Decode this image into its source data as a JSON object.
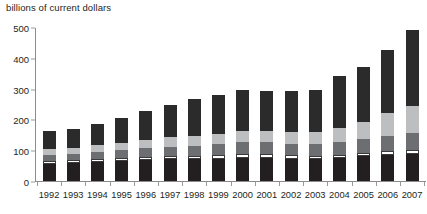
{
  "chart_data": {
    "type": "bar",
    "subtype": "stacked-bar",
    "title": "billions of current dollars",
    "xlabel": "",
    "ylabel": "billions of current dollars",
    "ylim": [
      0,
      500
    ],
    "yticks": [
      0,
      100,
      200,
      300,
      400,
      500
    ],
    "grid": false,
    "legend": "none",
    "categories": [
      "1992",
      "1993",
      "1994",
      "1995",
      "1996",
      "1997",
      "1998",
      "1999",
      "2000",
      "2001",
      "2002",
      "2003",
      "2004",
      "2005",
      "2006",
      "2007"
    ],
    "series": [
      {
        "name": "segment-1",
        "color": "#231f20",
        "values": [
          55,
          58,
          61,
          64,
          67,
          70,
          71,
          73,
          76,
          76,
          72,
          70,
          74,
          80,
          84,
          88
        ]
      },
      {
        "name": "segment-2",
        "color": "#ffffff",
        "values": [
          10,
          10,
          11,
          11,
          11,
          11,
          11,
          11,
          12,
          12,
          11,
          11,
          11,
          12,
          13,
          14
        ]
      },
      {
        "name": "segment-3",
        "color": "#6d6e71",
        "values": [
          20,
          21,
          23,
          26,
          28,
          31,
          33,
          35,
          38,
          38,
          37,
          38,
          41,
          45,
          50,
          54
        ]
      },
      {
        "name": "segment-4",
        "color": "#bcbec0",
        "values": [
          18,
          19,
          21,
          24,
          27,
          30,
          32,
          34,
          37,
          38,
          38,
          41,
          47,
          56,
          74,
          87
        ]
      },
      {
        "name": "segment-5",
        "color": "#2b2b2b",
        "values": [
          59,
          62,
          70,
          80,
          94,
          105,
          119,
          127,
          133,
          129,
          134,
          134,
          167,
          177,
          204,
          247
        ]
      }
    ],
    "totals": [
      162,
      170,
      186,
      205,
      227,
      247,
      266,
      280,
      296,
      293,
      292,
      294,
      340,
      370,
      425,
      490
    ],
    "axis_colors": {
      "axis_line": "#8c8c8c",
      "tick": "#9a9a9a",
      "text": "#231f20"
    }
  },
  "layout": {
    "bar_width_px": 13,
    "bar_pitch_px": 24.2,
    "first_bar_center_px": 14
  }
}
